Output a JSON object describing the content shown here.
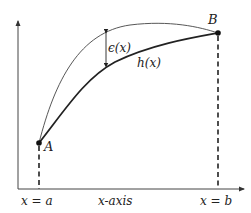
{
  "diagram": {
    "colors": {
      "axis": "#333333",
      "upper_curve": "#333333",
      "h_curve": "#222222",
      "dash": "#222222",
      "point": "#111111"
    },
    "labels": {
      "point_a": "A",
      "point_b": "B",
      "h_curve": "h(x)",
      "epsilon": "ϵ(x)",
      "x_eq_a": "x = a",
      "x_axis": "x-axis",
      "x_eq_b": "x = b"
    },
    "points": {
      "A": {
        "x": 39,
        "y": 143
      },
      "B": {
        "x": 218,
        "y": 33
      }
    },
    "axes": {
      "origin": {
        "x": 18,
        "y": 189
      },
      "y_top": 20,
      "x_right": 244
    }
  }
}
